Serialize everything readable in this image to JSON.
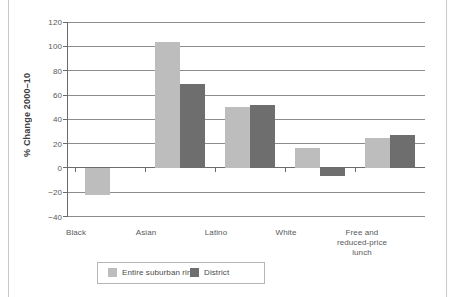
{
  "chart_data": {
    "type": "bar",
    "title": "",
    "subtitle": "",
    "xlabel": "",
    "ylabel": "% Change 2000–10",
    "categories": [
      "Black",
      "Asian",
      "Latino",
      "White",
      "Free and reduced-price lunch"
    ],
    "series": [
      {
        "name": "Entire suburban ring",
        "color": "#bdbdbd",
        "values": [
          -22,
          104,
          50,
          17,
          25
        ]
      },
      {
        "name": "District",
        "color": "#6e6e6e",
        "values": [
          1,
          69,
          52,
          -6.5,
          27
        ]
      }
    ],
    "ylim": [
      -40,
      120
    ],
    "yticks": [
      120,
      100,
      80,
      60,
      40,
      20,
      0,
      -20,
      -40
    ],
    "ytick_labels": [
      "120",
      "100",
      "80",
      "60",
      "40",
      "20",
      "0",
      "−20",
      "−40"
    ],
    "grid": true,
    "grid_axis": "y",
    "legend_position": "bottom-left",
    "zero_line": 0
  },
  "legend": {
    "entries": [
      {
        "label": "Entire suburban ring",
        "color": "#bdbdbd"
      },
      {
        "label": "District",
        "color": "#6e6e6e"
      }
    ]
  },
  "xaxis": {
    "labels": [
      {
        "line1": "Black",
        "line2": "",
        "line3": ""
      },
      {
        "line1": "Asian",
        "line2": "",
        "line3": ""
      },
      {
        "line1": "Latino",
        "line2": "",
        "line3": ""
      },
      {
        "line1": "White",
        "line2": "",
        "line3": ""
      },
      {
        "line1": "Free and",
        "line2": "reduced-price",
        "line3": "lunch"
      }
    ]
  },
  "colors": {
    "series_light": "#bdbdbd",
    "series_dark": "#6e6e6e",
    "axis": "#6a6a6a",
    "grid": "#8c8c8c",
    "text": "#58585a",
    "background": "#ffffff"
  }
}
